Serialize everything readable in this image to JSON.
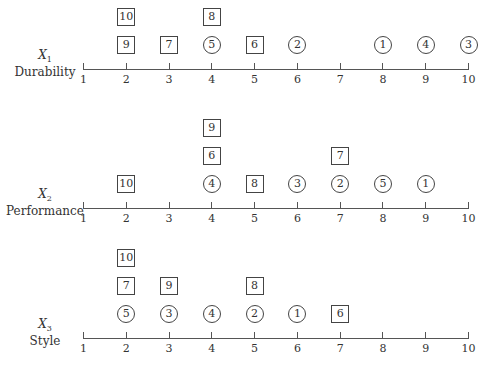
{
  "chart_data": {
    "type": "scatter",
    "title": "",
    "xlim": [
      1,
      10
    ],
    "x_ticks": [
      1,
      2,
      3,
      4,
      5,
      6,
      7,
      8,
      9,
      10
    ],
    "legend": {
      "circle": "item (circled)",
      "square": "item (boxed)"
    },
    "panels": [
      {
        "var": "X",
        "sub": "1",
        "label": "Durability",
        "points": [
          {
            "id": 10,
            "shape": "square",
            "x": 2,
            "level": 2
          },
          {
            "id": 9,
            "shape": "square",
            "x": 2,
            "level": 1
          },
          {
            "id": 7,
            "shape": "square",
            "x": 3,
            "level": 1
          },
          {
            "id": 8,
            "shape": "square",
            "x": 4,
            "level": 2
          },
          {
            "id": 5,
            "shape": "circle",
            "x": 4,
            "level": 1
          },
          {
            "id": 6,
            "shape": "square",
            "x": 5,
            "level": 1
          },
          {
            "id": 2,
            "shape": "circle",
            "x": 6,
            "level": 1
          },
          {
            "id": 1,
            "shape": "circle",
            "x": 8,
            "level": 1
          },
          {
            "id": 4,
            "shape": "circle",
            "x": 9,
            "level": 1
          },
          {
            "id": 3,
            "shape": "circle",
            "x": 10,
            "level": 1
          }
        ]
      },
      {
        "var": "X",
        "sub": "2",
        "label": "Performance",
        "points": [
          {
            "id": 10,
            "shape": "square",
            "x": 2,
            "level": 1
          },
          {
            "id": 9,
            "shape": "square",
            "x": 4,
            "level": 3
          },
          {
            "id": 6,
            "shape": "square",
            "x": 4,
            "level": 2
          },
          {
            "id": 4,
            "shape": "circle",
            "x": 4,
            "level": 1
          },
          {
            "id": 8,
            "shape": "square",
            "x": 5,
            "level": 1
          },
          {
            "id": 3,
            "shape": "circle",
            "x": 6,
            "level": 1
          },
          {
            "id": 7,
            "shape": "square",
            "x": 7,
            "level": 2
          },
          {
            "id": 2,
            "shape": "circle",
            "x": 7,
            "level": 1
          },
          {
            "id": 5,
            "shape": "circle",
            "x": 8,
            "level": 1
          },
          {
            "id": 1,
            "shape": "circle",
            "x": 9,
            "level": 1
          }
        ]
      },
      {
        "var": "X",
        "sub": "3",
        "label": "Style",
        "points": [
          {
            "id": 10,
            "shape": "square",
            "x": 2,
            "level": 3
          },
          {
            "id": 7,
            "shape": "square",
            "x": 2,
            "level": 2
          },
          {
            "id": 5,
            "shape": "circle",
            "x": 2,
            "level": 1
          },
          {
            "id": 9,
            "shape": "square",
            "x": 3,
            "level": 2
          },
          {
            "id": 3,
            "shape": "circle",
            "x": 3,
            "level": 1
          },
          {
            "id": 4,
            "shape": "circle",
            "x": 4,
            "level": 1
          },
          {
            "id": 8,
            "shape": "square",
            "x": 5,
            "level": 2
          },
          {
            "id": 2,
            "shape": "circle",
            "x": 5,
            "level": 1
          },
          {
            "id": 1,
            "shape": "circle",
            "x": 6,
            "level": 1
          },
          {
            "id": 6,
            "shape": "square",
            "x": 7,
            "level": 1
          }
        ]
      }
    ]
  },
  "colors": {
    "line": "#555555",
    "text": "#333333",
    "background": "#ffffff"
  }
}
